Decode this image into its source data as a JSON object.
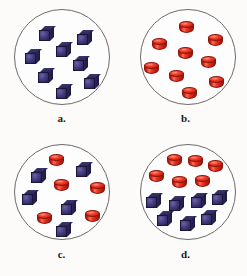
{
  "figure": {
    "background_color": "#fcfbfa",
    "circle_stroke_color": "#6e6a68"
  },
  "colors": {
    "cube_blue": "#3a3372",
    "cube_blue_dark": "#241f4c",
    "cylinder_red": "#e8321f",
    "cylinder_red_dark": "#8e1a0d",
    "label_text": "#1a1a1a"
  },
  "legend": {
    "cube_name": "blue-cube",
    "cylinder_name": "red-cylinder"
  },
  "chart_data": {
    "type": "scatter",
    "xlabel": "",
    "ylabel": "",
    "categories": [
      "a.",
      "b.",
      "c.",
      "d."
    ],
    "series": [
      {
        "name": "blue cubes",
        "values": [
          8,
          0,
          5,
          7
        ]
      },
      {
        "name": "red cylinders",
        "values": [
          0,
          9,
          5,
          6
        ]
      }
    ],
    "panels": [
      {
        "label": "a.",
        "blue_cubes": 8,
        "red_cylinders": 6,
        "total": 8,
        "shapes": [
          {
            "kind": "cube",
            "x": 39,
            "y": 26
          },
          {
            "kind": "cube",
            "x": 77,
            "y": 30
          },
          {
            "kind": "cube",
            "x": 56,
            "y": 42
          },
          {
            "kind": "cube",
            "x": 25,
            "y": 49
          },
          {
            "kind": "cube",
            "x": 73,
            "y": 56
          },
          {
            "kind": "cube",
            "x": 38,
            "y": 68
          },
          {
            "kind": "cube",
            "x": 84,
            "y": 74
          },
          {
            "kind": "cube",
            "x": 56,
            "y": 84
          }
        ]
      },
      {
        "label": "b.",
        "blue_cubes": 0,
        "red_cylinders": 9,
        "total": 9,
        "shapes": [
          {
            "kind": "cyl",
            "x": 55,
            "y": 21
          },
          {
            "kind": "cyl",
            "x": 84,
            "y": 34
          },
          {
            "kind": "cyl",
            "x": 28,
            "y": 38
          },
          {
            "kind": "cyl",
            "x": 54,
            "y": 47
          },
          {
            "kind": "cyl",
            "x": 77,
            "y": 56
          },
          {
            "kind": "cyl",
            "x": 20,
            "y": 62
          },
          {
            "kind": "cyl",
            "x": 45,
            "y": 70
          },
          {
            "kind": "cyl",
            "x": 85,
            "y": 76
          },
          {
            "kind": "cyl",
            "x": 58,
            "y": 87
          }
        ]
      },
      {
        "label": "c.",
        "blue_cubes": 5,
        "red_cylinders": 5,
        "total": 10,
        "shapes": [
          {
            "kind": "cyl",
            "x": 49,
            "y": 16
          },
          {
            "kind": "cube",
            "x": 76,
            "y": 24
          },
          {
            "kind": "cube",
            "x": 31,
            "y": 30
          },
          {
            "kind": "cyl",
            "x": 54,
            "y": 41
          },
          {
            "kind": "cyl",
            "x": 90,
            "y": 44
          },
          {
            "kind": "cube",
            "x": 22,
            "y": 52
          },
          {
            "kind": "cube",
            "x": 61,
            "y": 62
          },
          {
            "kind": "cyl",
            "x": 37,
            "y": 74
          },
          {
            "kind": "cyl",
            "x": 85,
            "y": 72
          },
          {
            "kind": "cube",
            "x": 56,
            "y": 84
          }
        ]
      },
      {
        "label": "d.",
        "blue_cubes": 7,
        "red_cylinders": 6,
        "total": 13,
        "shapes": [
          {
            "kind": "cyl",
            "x": 43,
            "y": 16
          },
          {
            "kind": "cyl",
            "x": 64,
            "y": 17
          },
          {
            "kind": "cyl",
            "x": 84,
            "y": 22
          },
          {
            "kind": "cyl",
            "x": 25,
            "y": 32
          },
          {
            "kind": "cyl",
            "x": 48,
            "y": 38
          },
          {
            "kind": "cyl",
            "x": 71,
            "y": 37
          },
          {
            "kind": "cube",
            "x": 22,
            "y": 55
          },
          {
            "kind": "cube",
            "x": 45,
            "y": 58
          },
          {
            "kind": "cube",
            "x": 67,
            "y": 55
          },
          {
            "kind": "cube",
            "x": 88,
            "y": 52
          },
          {
            "kind": "cube",
            "x": 33,
            "y": 73
          },
          {
            "kind": "cube",
            "x": 56,
            "y": 78
          },
          {
            "kind": "cube",
            "x": 77,
            "y": 72
          }
        ]
      }
    ]
  }
}
